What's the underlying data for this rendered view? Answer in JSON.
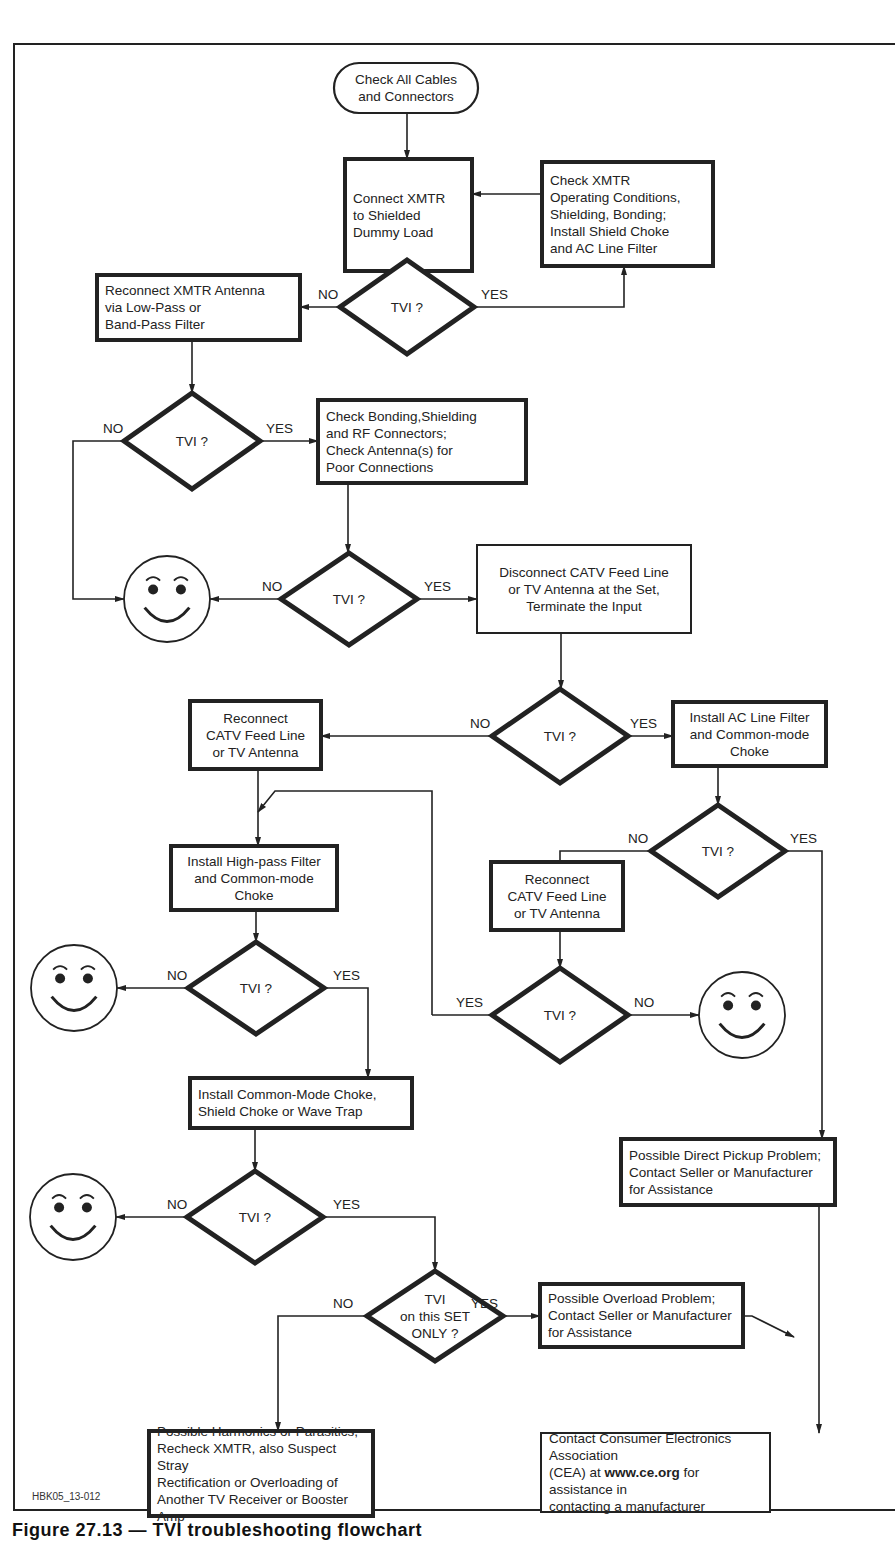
{
  "figure": {
    "caption": "Figure 27.13 — TVI troubleshooting flowchart",
    "code_label": "HBK05_13-012"
  },
  "colors": {
    "ink": "#222222",
    "background": "#ffffff"
  },
  "nodes": [
    {
      "id": "start",
      "type": "terminal",
      "x": 334,
      "y": 63,
      "w": 144,
      "h": 50,
      "align": "center",
      "text": "Check All Cables\nand Connectors"
    },
    {
      "id": "dummy_load",
      "type": "process",
      "x": 345,
      "y": 159,
      "w": 127,
      "h": 112,
      "align": "left",
      "text": "Connect XMTR\nto Shielded\nDummy Load"
    },
    {
      "id": "check_xmtr",
      "type": "process",
      "x": 542,
      "y": 162,
      "w": 171,
      "h": 104,
      "align": "left",
      "text": "Check XMTR\nOperating Conditions,\nShielding, Bonding;\nInstall Shield Choke\nand AC Line Filter"
    },
    {
      "id": "tvi1",
      "type": "decision",
      "cx": 407,
      "cy": 307,
      "hw": 67,
      "hh": 47,
      "text": "TVI ?"
    },
    {
      "id": "reconnect_antenna",
      "type": "process",
      "x": 97,
      "y": 275,
      "w": 203,
      "h": 65,
      "align": "left",
      "text": "Reconnect XMTR Antenna\nvia Low-Pass or\nBand-Pass Filter"
    },
    {
      "id": "tvi2",
      "type": "decision",
      "cx": 192,
      "cy": 441,
      "hw": 68,
      "hh": 48,
      "text": "TVI ?"
    },
    {
      "id": "check_bonding",
      "type": "process",
      "x": 318,
      "y": 400,
      "w": 208,
      "h": 83,
      "align": "left",
      "text": "Check Bonding,Shielding\nand RF Connectors;\nCheck Antenna(s) for\nPoor Connections"
    },
    {
      "id": "smiley1",
      "type": "smiley",
      "cx": 167,
      "cy": 599,
      "r": 43
    },
    {
      "id": "tvi3",
      "type": "decision",
      "cx": 349,
      "cy": 599,
      "hw": 68,
      "hh": 46,
      "text": "TVI ?"
    },
    {
      "id": "disconnect_catv",
      "type": "process",
      "x": 477,
      "y": 545,
      "w": 214,
      "h": 88,
      "align": "center",
      "thin": true,
      "text": "Disconnect CATV Feed Line\nor TV Antenna at the Set,\nTerminate the Input"
    },
    {
      "id": "tvi4",
      "type": "decision",
      "cx": 560,
      "cy": 736,
      "hw": 68,
      "hh": 47,
      "text": "TVI ?"
    },
    {
      "id": "reconnect_catv1",
      "type": "process",
      "x": 190,
      "y": 701,
      "w": 131,
      "h": 68,
      "align": "center",
      "text": "Reconnect\nCATV Feed Line\nor TV Antenna"
    },
    {
      "id": "install_ac_filter",
      "type": "process",
      "x": 673,
      "y": 702,
      "w": 153,
      "h": 64,
      "align": "center",
      "text": "Install AC Line Filter\nand Common-mode\nChoke"
    },
    {
      "id": "tvi5",
      "type": "decision",
      "cx": 718,
      "cy": 851,
      "hw": 67,
      "hh": 46,
      "text": "TVI ?"
    },
    {
      "id": "reconnect_catv2",
      "type": "process",
      "x": 491,
      "y": 862,
      "w": 132,
      "h": 68,
      "align": "center",
      "text": "Reconnect\nCATV Feed Line\nor TV Antenna"
    },
    {
      "id": "install_highpass",
      "type": "process",
      "x": 171,
      "y": 846,
      "w": 166,
      "h": 64,
      "align": "center",
      "text": "Install High-pass Filter\nand Common-mode\nChoke"
    },
    {
      "id": "smiley2",
      "type": "smiley",
      "cx": 74,
      "cy": 988,
      "r": 43
    },
    {
      "id": "tvi6",
      "type": "decision",
      "cx": 256,
      "cy": 988,
      "hw": 68,
      "hh": 46,
      "text": "TVI ?"
    },
    {
      "id": "tvi7",
      "type": "decision",
      "cx": 560,
      "cy": 1015,
      "hw": 68,
      "hh": 47,
      "text": "TVI ?"
    },
    {
      "id": "smiley3",
      "type": "smiley",
      "cx": 742,
      "cy": 1015,
      "r": 43
    },
    {
      "id": "install_cm_choke",
      "type": "process",
      "x": 190,
      "y": 1078,
      "w": 222,
      "h": 50,
      "align": "left",
      "text": "Install Common-Mode Choke,\nShield Choke or Wave Trap"
    },
    {
      "id": "direct_pickup",
      "type": "process",
      "x": 621,
      "y": 1139,
      "w": 214,
      "h": 66,
      "align": "left",
      "text": "Possible Direct Pickup Problem;\nContact Seller or Manufacturer\nfor Assistance"
    },
    {
      "id": "smiley4",
      "type": "smiley",
      "cx": 73,
      "cy": 1217,
      "r": 43
    },
    {
      "id": "tvi8",
      "type": "decision",
      "cx": 255,
      "cy": 1217,
      "hw": 68,
      "hh": 46,
      "text": "TVI ?"
    },
    {
      "id": "tvi_set_only",
      "type": "decision",
      "cx": 435,
      "cy": 1316,
      "hw": 68,
      "hh": 45,
      "text": "TVI\non this SET\nONLY ?"
    },
    {
      "id": "overload",
      "type": "process",
      "x": 540,
      "y": 1284,
      "w": 203,
      "h": 63,
      "align": "left",
      "text": "Possible Overload Problem;\nContact Seller or Manufacturer\nfor Assistance"
    },
    {
      "id": "harmonics",
      "type": "process",
      "x": 149,
      "y": 1431,
      "w": 224,
      "h": 85,
      "align": "left",
      "text": "Possible Harmonics or Parasitics,\nRecheck XMTR, also Suspect Stray\nRectification or Overloading of\nAnother TV Receiver or Booster Amp"
    },
    {
      "id": "contact_cea",
      "type": "process",
      "x": 541,
      "y": 1433,
      "w": 229,
      "h": 79,
      "align": "left",
      "thin": true,
      "text_parts": [
        "Contact Consumer Electronics Association\n(CEA) at ",
        "www.ce.org",
        " for assistance in\ncontacting a manufacturer"
      ]
    }
  ],
  "edges": [
    {
      "points": [
        [
          407,
          113
        ],
        [
          407,
          159
        ]
      ],
      "arrow": true
    },
    {
      "points": [
        [
          542,
          194
        ],
        [
          472,
          194
        ]
      ],
      "arrow": true
    },
    {
      "points": [
        [
          407,
          271
        ],
        [
          407,
          260
        ]
      ],
      "arrow": true
    },
    {
      "points": [
        [
          474,
          307
        ],
        [
          624,
          307
        ],
        [
          624,
          266
        ]
      ],
      "arrow": true,
      "label": "YES",
      "lx": 481,
      "ly": 287
    },
    {
      "points": [
        [
          340,
          307
        ],
        [
          300,
          307
        ]
      ],
      "arrow": true,
      "label": "NO",
      "lx": 318,
      "ly": 287
    },
    {
      "points": [
        [
          192,
          340
        ],
        [
          192,
          393
        ]
      ],
      "arrow": true
    },
    {
      "points": [
        [
          260,
          441
        ],
        [
          318,
          441
        ]
      ],
      "arrow": true,
      "label": "YES",
      "lx": 266,
      "ly": 421
    },
    {
      "points": [
        [
          124,
          441
        ],
        [
          73,
          441
        ],
        [
          73,
          599
        ],
        [
          124,
          599
        ]
      ],
      "arrow": true,
      "label": "NO",
      "lx": 103,
      "ly": 421
    },
    {
      "points": [
        [
          348,
          483
        ],
        [
          348,
          553
        ]
      ],
      "arrow": true
    },
    {
      "points": [
        [
          281,
          599
        ],
        [
          210,
          599
        ]
      ],
      "arrow": true,
      "label": "NO",
      "lx": 262,
      "ly": 579
    },
    {
      "points": [
        [
          417,
          599
        ],
        [
          477,
          599
        ]
      ],
      "arrow": true,
      "label": "YES",
      "lx": 424,
      "ly": 579
    },
    {
      "points": [
        [
          561,
          633
        ],
        [
          561,
          689
        ]
      ],
      "arrow": true
    },
    {
      "points": [
        [
          492,
          736
        ],
        [
          321,
          736
        ]
      ],
      "arrow": true,
      "label": "NO",
      "lx": 470,
      "ly": 716
    },
    {
      "points": [
        [
          628,
          736
        ],
        [
          673,
          736
        ]
      ],
      "arrow": true,
      "label": "YES",
      "lx": 630,
      "ly": 716
    },
    {
      "points": [
        [
          718,
          766
        ],
        [
          718,
          805
        ]
      ],
      "arrow": true
    },
    {
      "points": [
        [
          651,
          851
        ],
        [
          560,
          851
        ],
        [
          560,
          862
        ]
      ],
      "arrow": false,
      "label": "NO",
      "lx": 628,
      "ly": 831
    },
    {
      "points": [
        [
          785,
          851
        ],
        [
          822,
          851
        ],
        [
          822,
          1139
        ]
      ],
      "arrow": true,
      "label": "YES",
      "lx": 790,
      "ly": 831
    },
    {
      "points": [
        [
          258,
          769
        ],
        [
          258,
          846
        ]
      ],
      "arrow": true
    },
    {
      "points": [
        [
          432,
          1015
        ],
        [
          432,
          791
        ],
        [
          275,
          791
        ],
        [
          258,
          812
        ]
      ],
      "arrow": true
    },
    {
      "points": [
        [
          560,
          930
        ],
        [
          560,
          968
        ]
      ],
      "arrow": true
    },
    {
      "points": [
        [
          492,
          1015
        ],
        [
          432,
          1015
        ]
      ],
      "arrow": false,
      "label": "YES",
      "lx": 456,
      "ly": 995
    },
    {
      "points": [
        [
          628,
          1015
        ],
        [
          699,
          1015
        ]
      ],
      "arrow": true,
      "label": "NO",
      "lx": 634,
      "ly": 995
    },
    {
      "points": [
        [
          256,
          910
        ],
        [
          256,
          942
        ]
      ],
      "arrow": true
    },
    {
      "points": [
        [
          188,
          988
        ],
        [
          117,
          988
        ]
      ],
      "arrow": true,
      "label": "NO",
      "lx": 167,
      "ly": 968
    },
    {
      "points": [
        [
          324,
          988
        ],
        [
          368,
          988
        ],
        [
          368,
          1078
        ]
      ],
      "arrow": true,
      "label": "YES",
      "lx": 333,
      "ly": 968
    },
    {
      "points": [
        [
          255,
          1128
        ],
        [
          255,
          1171
        ]
      ],
      "arrow": true
    },
    {
      "points": [
        [
          187,
          1217
        ],
        [
          116,
          1217
        ]
      ],
      "arrow": true,
      "label": "NO",
      "lx": 167,
      "ly": 1197
    },
    {
      "points": [
        [
          323,
          1217
        ],
        [
          435,
          1217
        ],
        [
          435,
          1271
        ]
      ],
      "arrow": true,
      "label": "YES",
      "lx": 333,
      "ly": 1197
    },
    {
      "points": [
        [
          503,
          1316
        ],
        [
          540,
          1316
        ]
      ],
      "arrow": true,
      "label": "YES",
      "lx": 471,
      "ly": 1296
    },
    {
      "points": [
        [
          367,
          1316
        ],
        [
          278,
          1316
        ],
        [
          278,
          1431
        ]
      ],
      "arrow": true,
      "label": "NO",
      "lx": 333,
      "ly": 1296
    },
    {
      "points": [
        [
          743,
          1316
        ],
        [
          752,
          1316
        ],
        [
          794,
          1337
        ]
      ],
      "arrow": true
    },
    {
      "points": [
        [
          819,
          1205
        ],
        [
          819,
          1433
        ]
      ],
      "arrow": true
    }
  ]
}
